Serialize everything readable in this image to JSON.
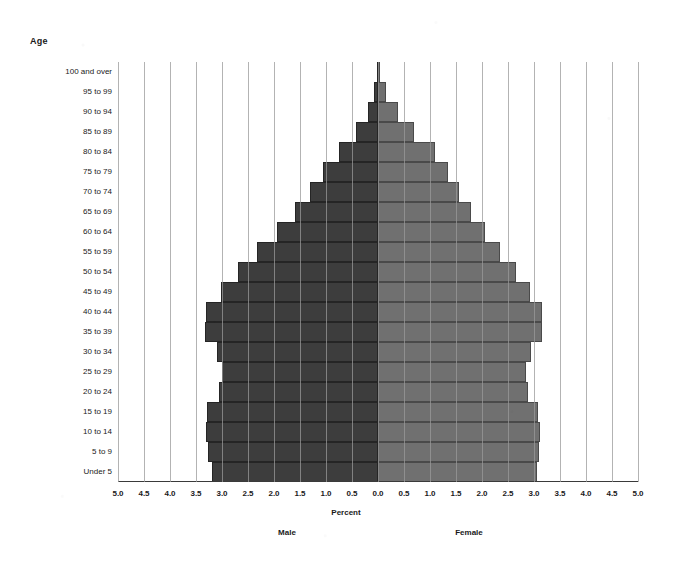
{
  "chart_data": {
    "type": "bar",
    "subtype": "population-pyramid",
    "title": "",
    "xlabel": "Percent",
    "ylabel": "Age",
    "grid": true,
    "legend_position": "below-axis",
    "orientation": "horizontal-diverging",
    "xlim": [
      -5.0,
      5.0
    ],
    "xticks": [
      "5.0",
      "4.5",
      "4.0",
      "3.5",
      "3.0",
      "2.5",
      "2.0",
      "1.5",
      "1.0",
      "0.5",
      "0.0",
      "0.5",
      "1.0",
      "1.5",
      "2.0",
      "2.5",
      "3.0",
      "3.5",
      "4.0",
      "4.5",
      "5.0"
    ],
    "xtick_values": [
      -5.0,
      -4.5,
      -4.0,
      -3.5,
      -3.0,
      -2.5,
      -2.0,
      -1.5,
      -1.0,
      -0.5,
      0.0,
      0.5,
      1.0,
      1.5,
      2.0,
      2.5,
      3.0,
      3.5,
      4.0,
      4.5,
      5.0
    ],
    "categories": [
      "Under 5",
      "5 to 9",
      "10 to 14",
      "15 to 19",
      "20 to 24",
      "25 to 29",
      "30 to 34",
      "35 to 39",
      "40 to 44",
      "45 to 49",
      "50 to 54",
      "55 to 59",
      "60 to 64",
      "65 to 69",
      "70 to 74",
      "75 to 79",
      "80 to 84",
      "85 to 89",
      "90 to 94",
      "95 to 99",
      "100 and over"
    ],
    "series": [
      {
        "name": "Male",
        "color": "#3d3d3d",
        "side": "left",
        "values": [
          3.2,
          3.27,
          3.3,
          3.28,
          3.05,
          3.0,
          3.1,
          3.32,
          3.3,
          3.02,
          2.7,
          2.32,
          1.95,
          1.6,
          1.3,
          1.05,
          0.75,
          0.42,
          0.2,
          0.07,
          0.02
        ]
      },
      {
        "name": "Female",
        "color": "#707070",
        "side": "right",
        "values": [
          3.05,
          3.1,
          3.12,
          3.08,
          2.88,
          2.85,
          2.95,
          3.15,
          3.15,
          2.92,
          2.65,
          2.35,
          2.05,
          1.78,
          1.55,
          1.35,
          1.1,
          0.7,
          0.38,
          0.15,
          0.04
        ]
      }
    ]
  },
  "axis": {
    "age_title": "Age",
    "percent_title": "Percent"
  },
  "legend": {
    "male": "Male",
    "female": "Female"
  }
}
